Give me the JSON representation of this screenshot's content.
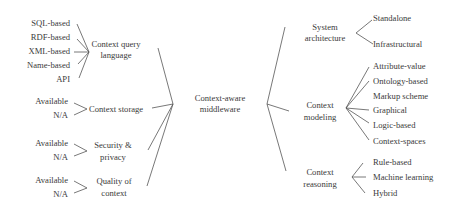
{
  "center": {
    "line1": "Context-aware",
    "line2": "middleware"
  },
  "left_branches": {
    "query_language": {
      "label_line1": "Context query",
      "label_line2": "language",
      "leaves": [
        "SQL-based",
        "RDF-based",
        "XML-based",
        "Name-based",
        "API"
      ]
    },
    "storage": {
      "label_line1": "Context storage",
      "leaves": [
        "Available",
        "N/A"
      ]
    },
    "security": {
      "label_line1": "Security &",
      "label_line2": "privacy",
      "leaves": [
        "Available",
        "N/A"
      ]
    },
    "quality": {
      "label_line1": "Quality of",
      "label_line2": "context",
      "leaves": [
        "Available",
        "N/A"
      ]
    }
  },
  "right_branches": {
    "architecture": {
      "label_line1": "System",
      "label_line2": "architecture",
      "leaves": [
        "Standalone",
        "Infrastructural"
      ]
    },
    "modeling": {
      "label_line1": "Context",
      "label_line2": "modeling",
      "leaves": [
        "Attribute-value",
        "Ontology-based",
        "Markup scheme",
        "Graphical",
        "Logic-based",
        "Context-spaces"
      ]
    },
    "reasoning": {
      "label_line1": "Context",
      "label_line2": "reasoning",
      "leaves": [
        "Rule-based",
        "Machine learning",
        "Hybrid"
      ]
    }
  }
}
